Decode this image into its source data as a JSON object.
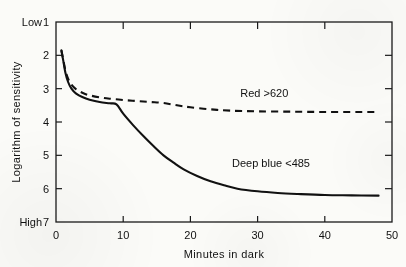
{
  "chart_data": {
    "type": "line",
    "title": "",
    "subtitle": "",
    "xlabel": "Minutes in dark",
    "ylabel": "Logarithm of sensitivity",
    "xlim": [
      0,
      50
    ],
    "ylim": [
      1,
      7
    ],
    "y_inverted": true,
    "grid": false,
    "legend_position": "inline-annotation",
    "x_ticks": [
      0,
      10,
      20,
      30,
      40,
      50
    ],
    "x_tick_labels": [
      "0",
      "10",
      "20",
      "30",
      "40",
      "50"
    ],
    "y_ticks": [
      1,
      2,
      3,
      4,
      5,
      6,
      7
    ],
    "y_tick_labels": [
      "1",
      "2",
      "3",
      "4",
      "5",
      "6",
      "7"
    ],
    "y_axis_endpoint_labels": {
      "top": "Low",
      "bottom": "High"
    },
    "annotations": [
      {
        "text": "Red >620",
        "x": 31,
        "y": 3.25
      },
      {
        "text": "Deep blue <485",
        "x": 32,
        "y": 5.35
      }
    ],
    "series": [
      {
        "name": "Red >620",
        "style": "dashed",
        "color": "#111111",
        "points": [
          [
            0.8,
            1.85
          ],
          [
            1.1,
            2.15
          ],
          [
            1.4,
            2.45
          ],
          [
            1.8,
            2.7
          ],
          [
            2.3,
            2.88
          ],
          [
            3.0,
            3.02
          ],
          [
            4.0,
            3.13
          ],
          [
            5.0,
            3.2
          ],
          [
            6.5,
            3.26
          ],
          [
            8.0,
            3.3
          ],
          [
            10.0,
            3.34
          ],
          [
            12.0,
            3.37
          ],
          [
            14.0,
            3.4
          ],
          [
            16.0,
            3.43
          ],
          [
            18.0,
            3.5
          ],
          [
            20.0,
            3.56
          ],
          [
            23.0,
            3.62
          ],
          [
            26.0,
            3.66
          ],
          [
            30.0,
            3.68
          ],
          [
            35.0,
            3.69
          ],
          [
            40.0,
            3.7
          ],
          [
            45.0,
            3.7
          ],
          [
            48.0,
            3.7
          ]
        ]
      },
      {
        "name": "Deep blue <485",
        "style": "solid",
        "color": "#111111",
        "points": [
          [
            0.8,
            1.85
          ],
          [
            1.1,
            2.18
          ],
          [
            1.4,
            2.52
          ],
          [
            1.8,
            2.8
          ],
          [
            2.3,
            3.0
          ],
          [
            3.0,
            3.15
          ],
          [
            4.0,
            3.26
          ],
          [
            5.0,
            3.33
          ],
          [
            6.5,
            3.4
          ],
          [
            8.0,
            3.44
          ],
          [
            9.0,
            3.47
          ],
          [
            10.0,
            3.75
          ],
          [
            11.5,
            4.1
          ],
          [
            13.0,
            4.42
          ],
          [
            14.5,
            4.72
          ],
          [
            16.0,
            5.0
          ],
          [
            17.5,
            5.22
          ],
          [
            19.0,
            5.42
          ],
          [
            21.0,
            5.62
          ],
          [
            23.0,
            5.78
          ],
          [
            25.0,
            5.9
          ],
          [
            27.0,
            6.0
          ],
          [
            30.0,
            6.08
          ],
          [
            33.0,
            6.13
          ],
          [
            36.0,
            6.16
          ],
          [
            40.0,
            6.19
          ],
          [
            44.0,
            6.2
          ],
          [
            48.0,
            6.21
          ]
        ]
      }
    ]
  },
  "axes": {
    "y_top_label": "Low",
    "y_bottom_label": "High",
    "y_title": "Logarithm of sensitivity",
    "x_title": "Minutes in dark"
  },
  "labels": {
    "red_series": "Red >620",
    "blue_series": "Deep blue <485"
  },
  "colors": {
    "ink": "#111111",
    "paper": "#fbfbf8",
    "axis": "#1a1a1a"
  },
  "tick_text": {
    "y": [
      "1",
      "2",
      "3",
      "4",
      "5",
      "6",
      "7"
    ],
    "x": [
      "0",
      "10",
      "20",
      "30",
      "40",
      "50"
    ]
  }
}
